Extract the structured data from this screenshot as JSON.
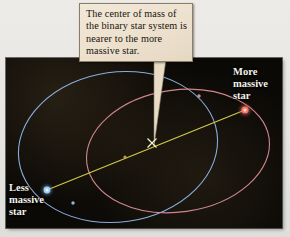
{
  "figure": {
    "background_color": "#e9e8e4",
    "panel_color": "#0b0906"
  },
  "callout": {
    "text": "The center of mass of the binary star system is nearer to the more massive star.",
    "background_color": "#ece0cd",
    "border_color": "#8a7c66",
    "pointer_target": "center-of-mass-marker"
  },
  "labels": {
    "more_massive": "More\nmassive\nstar",
    "less_massive": "Less\nmassive\nstar"
  },
  "diagram": {
    "type": "astronomy-orbit-diagram",
    "orbits": [
      {
        "name": "less-massive-star-orbit",
        "color": "#8fb6e8",
        "cx": 118,
        "cy": 147,
        "rx": 100,
        "ry": 75,
        "rotation_deg": -8,
        "stroke_width": 1.1
      },
      {
        "name": "more-massive-star-orbit",
        "color": "#d98c94",
        "cx": 178,
        "cy": 151,
        "rx": 92,
        "ry": 61,
        "rotation_deg": -8,
        "stroke_width": 1.1
      }
    ],
    "stars": [
      {
        "name": "more-massive-star",
        "color": "#f06a62",
        "glow_color": "#ff9a8a",
        "x": 245,
        "y": 110,
        "radius": 3.6
      },
      {
        "name": "less-massive-star",
        "color": "#8ec4f0",
        "glow_color": "#bfe0ff",
        "x": 47,
        "y": 190,
        "radius": 3.4
      }
    ],
    "center_of_mass": {
      "name": "center-of-mass-marker",
      "glyph": "x-marker",
      "color": "#f2efd0",
      "x": 152,
      "y": 143,
      "size": 4.5
    },
    "connecting_line": {
      "name": "separation-axis-line",
      "color": "#d8d24a",
      "from_x": 47,
      "from_y": 190,
      "to_x": 245,
      "to_y": 110,
      "stroke_width": 1.2
    },
    "orbit_markers": [
      {
        "name": "blue-orbit-tick",
        "color": "#9fc6ef",
        "x": 73,
        "y": 203,
        "radius": 1.6
      },
      {
        "name": "red-orbit-tick",
        "color": "#e2a0a6",
        "x": 199,
        "y": 96,
        "radius": 1.6
      },
      {
        "name": "orbit-intersection-node",
        "color": "#caa25a",
        "x": 125,
        "y": 157,
        "radius": 1.5
      }
    ]
  }
}
